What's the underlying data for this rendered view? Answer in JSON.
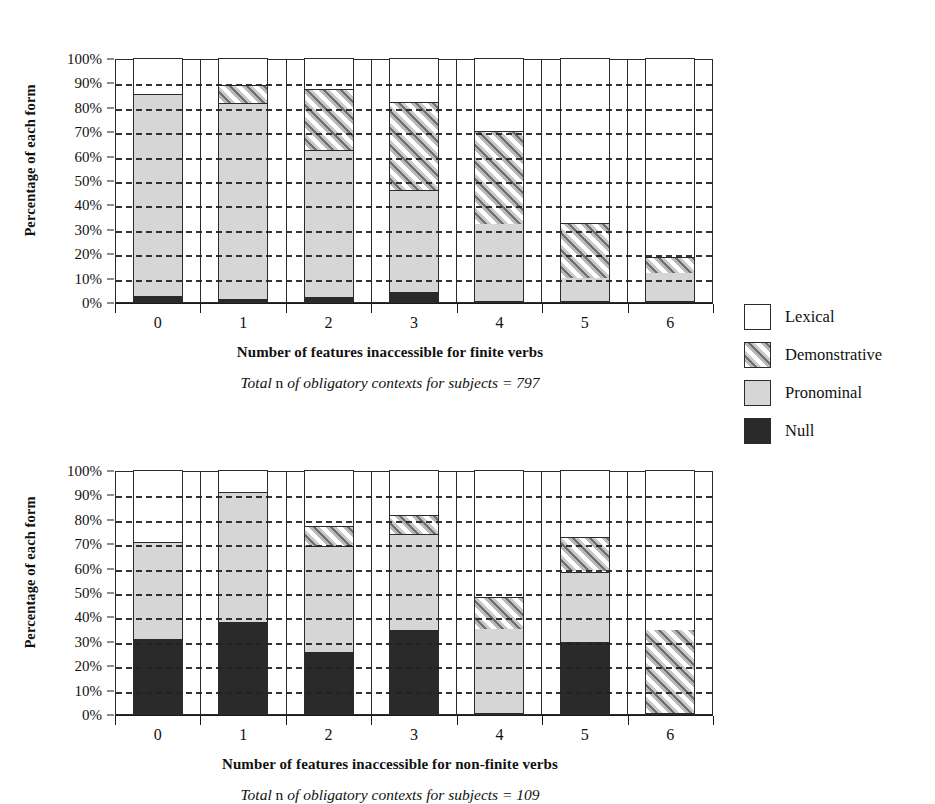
{
  "legend": {
    "items": [
      {
        "key": "lexical",
        "label": "Lexical",
        "fill": "lex"
      },
      {
        "key": "demonstrative",
        "label": "Demonstrative",
        "fill": "demo"
      },
      {
        "key": "pronominal",
        "label": "Pronominal",
        "fill": "pron"
      },
      {
        "key": "null",
        "label": "Null",
        "fill": "null"
      }
    ]
  },
  "charts": [
    {
      "id": "chart-1",
      "ylabel": "Percentage of each form",
      "xlabel": "Number of features inaccessible for finite verbs",
      "subtitle_lead": "Total",
      "subtitle_upright": "n",
      "subtitle_rest": "of obligatory contexts for subjects = 797"
    },
    {
      "id": "chart-2",
      "ylabel": "Percentage of each form",
      "xlabel": "Number of features inaccessible for non-finite verbs",
      "subtitle_lead": "Total",
      "subtitle_upright": "n",
      "subtitle_rest": "of obligatory contexts for subjects = 109"
    }
  ],
  "chart_data": [
    {
      "type": "bar",
      "stacked": true,
      "title": "",
      "xlabel": "Number of features inaccessible for finite verbs",
      "ylabel": "Percentage of each form",
      "subtitle": "Total n of obligatory contexts for subjects = 797",
      "categories": [
        "0",
        "1",
        "2",
        "3",
        "4",
        "5",
        "6"
      ],
      "ylim": [
        0,
        100
      ],
      "yticks": [
        "0%",
        "10%",
        "20%",
        "30%",
        "40%",
        "50%",
        "60%",
        "70%",
        "80%",
        "90%",
        "100%"
      ],
      "grid": true,
      "legend_position": "right",
      "series": [
        {
          "name": "Null",
          "values": [
            2,
            1,
            1.5,
            3.5,
            0,
            0,
            0
          ]
        },
        {
          "name": "Pronominal",
          "values": [
            83,
            80,
            60.5,
            42,
            31.5,
            9.5,
            11.5
          ]
        },
        {
          "name": "Demonstrative",
          "values": [
            0,
            7.5,
            25,
            36,
            38,
            22.5,
            6.5
          ]
        },
        {
          "name": "Lexical",
          "values": [
            15,
            11.5,
            13,
            18.5,
            30.5,
            68,
            82
          ]
        }
      ],
      "cumulative_tops": {
        "Null": [
          2,
          1,
          1.5,
          3.5,
          0,
          0,
          0
        ],
        "Pronominal": [
          85,
          81,
          62,
          45.5,
          31.5,
          9.5,
          11.5
        ],
        "Demonstrative": [
          85,
          88.5,
          87,
          81.5,
          69.5,
          32,
          18
        ],
        "Lexical": [
          100,
          100,
          100,
          100,
          100,
          100,
          100
        ]
      }
    },
    {
      "type": "bar",
      "stacked": true,
      "title": "",
      "xlabel": "Number of features inaccessible for non-finite verbs",
      "ylabel": "Percentage of each form",
      "subtitle": "Total n of obligatory contexts for subjects = 109",
      "categories": [
        "0",
        "1",
        "2",
        "3",
        "4",
        "5",
        "6"
      ],
      "ylim": [
        0,
        100
      ],
      "yticks": [
        "0%",
        "10%",
        "20%",
        "30%",
        "40%",
        "50%",
        "60%",
        "70%",
        "80%",
        "90%",
        "100%"
      ],
      "grid": true,
      "legend_position": "right",
      "series": [
        {
          "name": "Null",
          "values": [
            30.5,
            37.5,
            25,
            34,
            0,
            29,
            0
          ]
        },
        {
          "name": "Pronominal",
          "values": [
            39.5,
            53,
            43.5,
            39.5,
            34.5,
            29,
            0
          ]
        },
        {
          "name": "Demonstrative",
          "values": [
            0,
            0,
            8,
            7.5,
            13,
            14,
            34
          ]
        },
        {
          "name": "Lexical",
          "values": [
            30,
            9.5,
            23.5,
            19,
            52.5,
            28,
            66
          ]
        }
      ],
      "cumulative_tops": {
        "Null": [
          30.5,
          37.5,
          25,
          34,
          0,
          29,
          0
        ],
        "Pronominal": [
          70,
          90.5,
          68.5,
          73.5,
          34.5,
          58,
          0
        ],
        "Demonstrative": [
          70,
          90.5,
          76.5,
          81,
          47.5,
          72,
          34
        ],
        "Lexical": [
          100,
          100,
          100,
          100,
          100,
          100,
          100
        ]
      }
    }
  ]
}
